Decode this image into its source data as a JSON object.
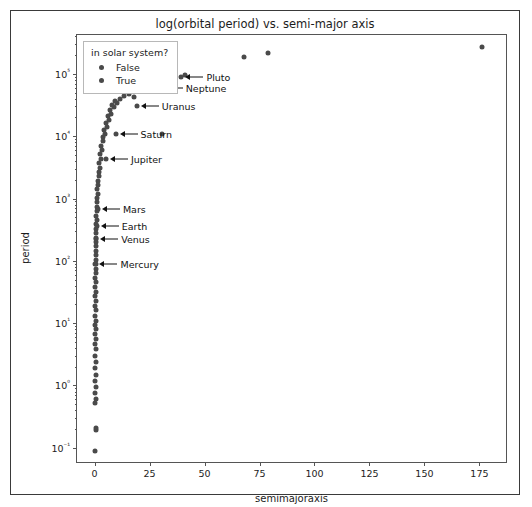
{
  "figure": {
    "title": "log(orbital period) vs. semi-major axis",
    "xaxis_title": "semimajoraxis",
    "yaxis_title": "period"
  },
  "legend": {
    "title": "in solar system?",
    "entries": [
      {
        "label": "False",
        "color": "#4a4a4a"
      },
      {
        "label": "True",
        "color": "#4a4a4a"
      }
    ]
  },
  "chart_data": {
    "type": "scatter",
    "title": "log(orbital period) vs. semi-major axis",
    "xlabel": "semimajoraxis",
    "ylabel": "period",
    "xscale": "linear",
    "yscale": "log",
    "xlim": [
      -8,
      188
    ],
    "ylim": [
      0.055,
      420000
    ],
    "grid": false,
    "legend_position": "upper left",
    "legend_title": "in solar system?",
    "marker_color": "#4a4a4a",
    "marker_size": 5,
    "xticks": [
      0,
      25,
      50,
      75,
      100,
      125,
      150,
      175
    ],
    "xticklabels": [
      "0",
      "25",
      "50",
      "75",
      "100",
      "125",
      "150",
      "175"
    ],
    "yticks": [
      0.1,
      1,
      10,
      100,
      1000,
      10000,
      100000
    ],
    "yticklabels": [
      "10⁻¹",
      "10⁰",
      "10¹",
      "10²",
      "10³",
      "10⁴",
      "10⁵"
    ],
    "series": [
      {
        "name": "False",
        "description": "exoplanets — dense near-vertical column at small semi-major axis",
        "points": [
          [
            0.2,
            0.09
          ],
          [
            0.6,
            0.19
          ],
          [
            0.5,
            0.21
          ],
          [
            0.4,
            0.52
          ],
          [
            0.5,
            0.6
          ],
          [
            0.4,
            0.75
          ],
          [
            0.5,
            0.95
          ],
          [
            0.4,
            1.2
          ],
          [
            0.5,
            1.5
          ],
          [
            0.4,
            1.9
          ],
          [
            0.5,
            2.4
          ],
          [
            0.4,
            3.0
          ],
          [
            0.5,
            3.8
          ],
          [
            0.4,
            4.6
          ],
          [
            0.5,
            5.6
          ],
          [
            0.4,
            6.8
          ],
          [
            0.5,
            8.0
          ],
          [
            0.4,
            9.5
          ],
          [
            0.5,
            11
          ],
          [
            0.4,
            13
          ],
          [
            0.5,
            16
          ],
          [
            0.4,
            19
          ],
          [
            0.5,
            23
          ],
          [
            0.4,
            27
          ],
          [
            0.5,
            32
          ],
          [
            0.4,
            38
          ],
          [
            0.5,
            45
          ],
          [
            0.4,
            53
          ],
          [
            0.6,
            63
          ],
          [
            0.5,
            74
          ],
          [
            0.6,
            88
          ],
          [
            0.5,
            104
          ],
          [
            0.6,
            123
          ],
          [
            0.5,
            145
          ],
          [
            0.7,
            170
          ],
          [
            0.6,
            200
          ],
          [
            0.7,
            236
          ],
          [
            0.6,
            278
          ],
          [
            0.8,
            327
          ],
          [
            0.7,
            385
          ],
          [
            0.9,
            453
          ],
          [
            0.8,
            533
          ],
          [
            1.0,
            627
          ],
          [
            0.9,
            738
          ],
          [
            1.2,
            868
          ],
          [
            1.1,
            1020
          ],
          [
            1.4,
            1200
          ],
          [
            1.3,
            1400
          ],
          [
            1.7,
            1640
          ],
          [
            1.5,
            1930
          ],
          [
            2.0,
            2270
          ],
          [
            1.8,
            2670
          ],
          [
            2.4,
            3140
          ],
          [
            2.2,
            3690
          ],
          [
            2.9,
            4340
          ],
          [
            2.6,
            5100
          ],
          [
            3.4,
            6000
          ],
          [
            3.1,
            7050
          ],
          [
            4.0,
            8300
          ],
          [
            3.7,
            9750
          ],
          [
            4.7,
            11000
          ],
          [
            4.3,
            12500
          ],
          [
            5.5,
            14000
          ],
          [
            5.0,
            16500
          ],
          [
            6.4,
            18500
          ],
          [
            5.9,
            21000
          ],
          [
            7.4,
            23000
          ],
          [
            6.9,
            26000
          ],
          [
            8.6,
            29000
          ],
          [
            8.0,
            32000
          ],
          [
            10.0,
            34000
          ],
          [
            9.3,
            37000
          ],
          [
            11.6,
            40000
          ],
          [
            13.5,
            44000
          ],
          [
            15.7,
            48000
          ],
          [
            18.0,
            43000
          ],
          [
            21.0,
            55000
          ],
          [
            30.5,
            11000
          ],
          [
            33.0,
            78000
          ],
          [
            41.0,
            96000
          ],
          [
            68.0,
            185000
          ],
          [
            79.0,
            215000
          ],
          [
            176.0,
            270000
          ]
        ]
      },
      {
        "name": "True",
        "description": "solar system planets (annotated)",
        "points": [
          [
            0.39,
            88
          ],
          [
            0.72,
            225
          ],
          [
            1.0,
            365
          ],
          [
            1.52,
            687
          ],
          [
            5.2,
            4333
          ],
          [
            9.54,
            10759
          ],
          [
            19.2,
            30687
          ],
          [
            30.07,
            60190
          ],
          [
            39.48,
            90560
          ]
        ]
      }
    ],
    "annotations": [
      {
        "label": "Pluto",
        "x": 39.48,
        "y": 90560
      },
      {
        "label": "Neptune",
        "x": 30.07,
        "y": 60190
      },
      {
        "label": "Uranus",
        "x": 19.2,
        "y": 30687
      },
      {
        "label": "Saturn",
        "x": 9.54,
        "y": 10759
      },
      {
        "label": "Jupiter",
        "x": 5.2,
        "y": 4333
      },
      {
        "label": "Mars",
        "x": 1.52,
        "y": 687
      },
      {
        "label": "Earth",
        "x": 1.0,
        "y": 365
      },
      {
        "label": "Venus",
        "x": 0.72,
        "y": 225
      },
      {
        "label": "Mercury",
        "x": 0.39,
        "y": 88
      }
    ]
  }
}
